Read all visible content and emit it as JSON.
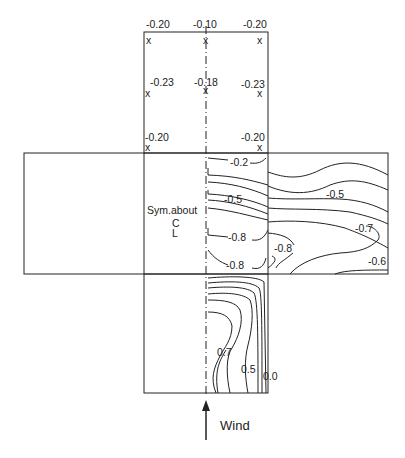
{
  "diagram": {
    "type": "roof pressure coefficient contour plot (cross-shaped layout)",
    "top_panel": {
      "points": [
        {
          "label": "-0.20",
          "pos": "top-left"
        },
        {
          "label": "-0.10",
          "pos": "top-center"
        },
        {
          "label": "-0.20",
          "pos": "top-right"
        },
        {
          "label": "-0.23",
          "pos": "middle-left"
        },
        {
          "label": "-0.18",
          "pos": "middle-center"
        },
        {
          "label": "-0.23",
          "pos": "middle-right"
        },
        {
          "label": "-0.20",
          "pos": "bottom-left"
        },
        {
          "label": "-0.20",
          "pos": "bottom-right"
        }
      ],
      "marker": "x"
    },
    "middle_panel": {
      "symmetry_note": [
        "Sym.about",
        "C",
        "L"
      ],
      "contour_labels": [
        "-0.2",
        "-0.5",
        "-0.8",
        "-0.8",
        "-0.8",
        "-0.5",
        "-0.7",
        "-0.6"
      ]
    },
    "bottom_panel": {
      "contour_labels": [
        "0.7",
        "0.5",
        "0.0"
      ]
    },
    "wind_label": "Wind",
    "line_color": "#222222"
  }
}
